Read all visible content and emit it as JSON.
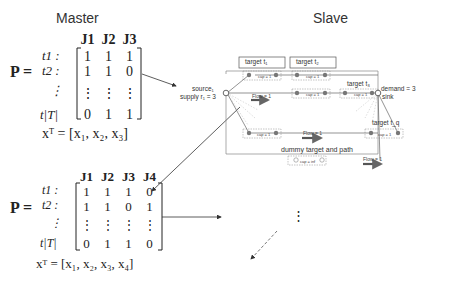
{
  "titles": {
    "master": "Master",
    "slave": "Slave"
  },
  "master1": {
    "P_label": "P =",
    "columns": [
      "J1",
      "J2",
      "J3"
    ],
    "rows": [
      {
        "label": "t1 :",
        "values": [
          "1",
          "1",
          "1"
        ]
      },
      {
        "label": "t2 :",
        "values": [
          "1",
          "1",
          "0"
        ]
      },
      {
        "label": "⋮",
        "values": [
          "⋮",
          "⋮",
          "⋮"
        ]
      },
      {
        "label": "t|T|",
        "values": [
          "0",
          "1",
          "1"
        ]
      }
    ],
    "x_vector": "xᵀ = [x₁, x₂, x₃]"
  },
  "master2": {
    "P_label": "P =",
    "columns": [
      "J1",
      "J2",
      "J3",
      "J4"
    ],
    "rows": [
      {
        "label": "t1 :",
        "values": [
          "1",
          "1",
          "1",
          "0"
        ]
      },
      {
        "label": "t2 :",
        "values": [
          "1",
          "1",
          "0",
          "1"
        ]
      },
      {
        "label": "⋮",
        "values": [
          "⋮",
          "⋮",
          "⋮",
          "⋮"
        ]
      },
      {
        "label": "t|T|",
        "values": [
          "0",
          "1",
          "1",
          "0"
        ]
      }
    ],
    "x_vector": "xᵀ = [x₁, x₂, x₃, x₄]"
  },
  "slave": {
    "source_label": "source₁",
    "supply_label": "supply r₁ = 3",
    "demand_label": "demand = 3",
    "sink_label": "sink",
    "targets": [
      "target t₁",
      "target t₂",
      "target t₃",
      "target t_q"
    ],
    "cap_label": "cap = 1",
    "cap_inf_label": "cap = inf",
    "flow_label": "Flow = 1",
    "dummy_label": "dummy target and path",
    "ellipsis": "⋮"
  }
}
